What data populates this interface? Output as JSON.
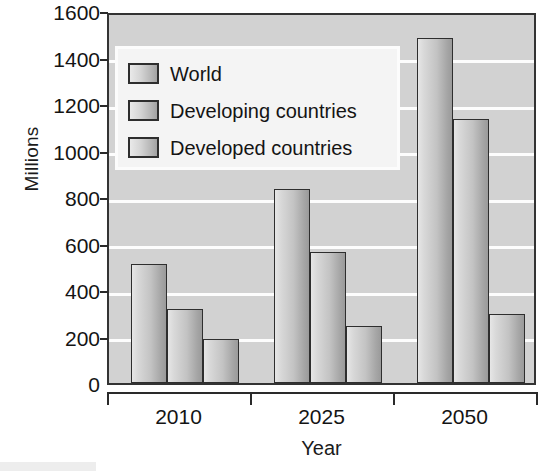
{
  "chart_data": {
    "type": "bar",
    "title": "",
    "subtitle": "",
    "xlabel": "Year",
    "ylabel": "Millions",
    "categories": [
      "2010",
      "2025",
      "2050"
    ],
    "series": [
      {
        "name": "World",
        "values": [
          510,
          835,
          1485
        ]
      },
      {
        "name": "Developing countries",
        "values": [
          320,
          565,
          1135
        ]
      },
      {
        "name": "Developed countries",
        "values": [
          190,
          245,
          295
        ]
      }
    ],
    "ylim": [
      0,
      1600
    ],
    "ytick_step": 200,
    "ytick_labels": [
      "0",
      "200",
      "400",
      "600",
      "800",
      "1000",
      "1200",
      "1400",
      "1600"
    ],
    "grid": true,
    "grid_orientation": "horizontal",
    "legend_position": "upper-left-inside",
    "annotations": []
  },
  "legend": {
    "entries": [
      {
        "label": "World",
        "swatch": "gray-gradient-swatch"
      },
      {
        "label": "Developing countries",
        "swatch": "gray-gradient-swatch"
      },
      {
        "label": "Developed countries",
        "swatch": "gray-gradient-swatch"
      }
    ]
  },
  "axes": {
    "y_title": "Millions",
    "x_title": "Year",
    "y_ticks": [
      "1600",
      "1400",
      "1200",
      "1000",
      "800",
      "600",
      "400",
      "200",
      "0"
    ],
    "x_ticks": [
      "2010",
      "2025",
      "2050"
    ]
  },
  "colors": {
    "plot_background": "#d2d2d2",
    "gridline": "#fdfdfd",
    "bar_outline": "#2e2e2e",
    "bar_fill_light": "#e6e6e6",
    "bar_fill_dark": "#9a9a9a",
    "axis": "#2a2a2a",
    "text": "#141414",
    "legend_background": "#f4f4f4"
  }
}
